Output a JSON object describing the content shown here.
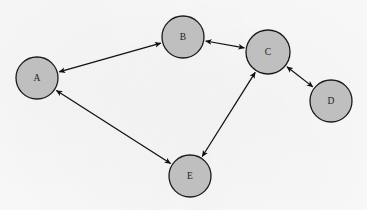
{
  "diagram": {
    "background_color": "#fafafa",
    "node_fill_color": "#bfbfbf",
    "node_stroke_color": "#1a1a1a",
    "edge_color": "#101010",
    "label_color": "#1c1c1c",
    "nodes": [
      {
        "id": "A",
        "label": "A",
        "cx": 37,
        "cy": 78,
        "r": 21
      },
      {
        "id": "B",
        "label": "B",
        "cx": 183,
        "cy": 37,
        "r": 21
      },
      {
        "id": "C",
        "label": "C",
        "cx": 268,
        "cy": 52,
        "r": 22
      },
      {
        "id": "D",
        "label": "D",
        "cx": 331,
        "cy": 101,
        "r": 21
      },
      {
        "id": "E",
        "label": "E",
        "cx": 190,
        "cy": 176,
        "r": 21
      }
    ],
    "edges": [
      {
        "from": "A",
        "to": "B",
        "arrows": "both"
      },
      {
        "from": "B",
        "to": "C",
        "arrows": "both"
      },
      {
        "from": "C",
        "to": "D",
        "arrows": "both"
      },
      {
        "from": "C",
        "to": "E",
        "arrows": "both"
      },
      {
        "from": "A",
        "to": "E",
        "arrows": "both"
      }
    ]
  }
}
